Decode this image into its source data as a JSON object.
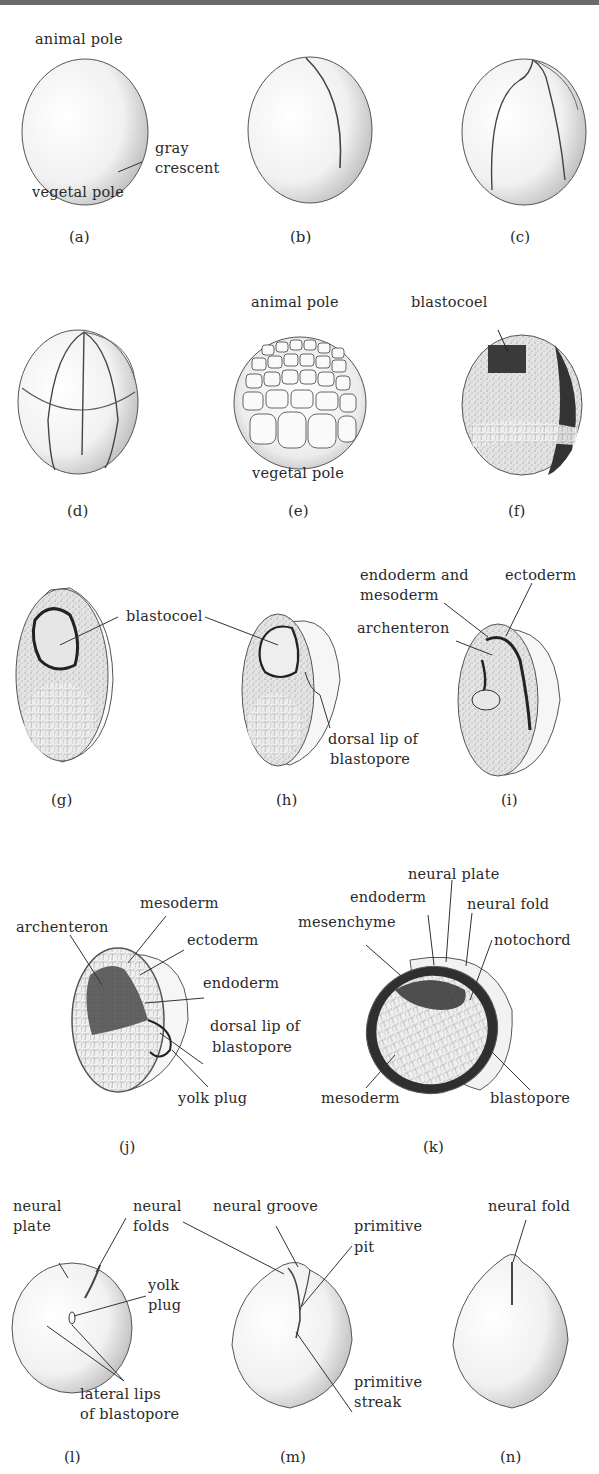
{
  "figure": {
    "panels": [
      {
        "id": "a",
        "caption": "(a)",
        "labels": {
          "animal_pole": "animal pole",
          "gray_crescent_1": "gray",
          "gray_crescent_2": "crescent",
          "vegetal_pole": "vegetal pole"
        }
      },
      {
        "id": "b",
        "caption": "(b)",
        "labels": {}
      },
      {
        "id": "c",
        "caption": "(c)",
        "labels": {}
      },
      {
        "id": "d",
        "caption": "(d)",
        "labels": {}
      },
      {
        "id": "e",
        "caption": "(e)",
        "labels": {
          "animal_pole": "animal pole",
          "vegetal_pole": "vegetal pole"
        }
      },
      {
        "id": "f",
        "caption": "(f)",
        "labels": {
          "blastocoel": "blastocoel"
        }
      },
      {
        "id": "g",
        "caption": "(g)",
        "labels": {}
      },
      {
        "id": "h",
        "caption": "(h)",
        "labels": {
          "blastocoel": "blastocoel",
          "dorsal_lip_1": "dorsal lip of",
          "dorsal_lip_2": "blastopore"
        }
      },
      {
        "id": "i",
        "caption": "(i)",
        "labels": {
          "endo_meso_1": "endoderm and",
          "endo_meso_2": "mesoderm",
          "ectoderm": "ectoderm",
          "archenteron": "archenteron"
        }
      },
      {
        "id": "j",
        "caption": "(j)",
        "labels": {
          "mesoderm": "mesoderm",
          "archenteron": "archenteron",
          "ectoderm": "ectoderm",
          "endoderm": "endoderm",
          "dorsal_lip_1": "dorsal lip of",
          "dorsal_lip_2": "blastopore",
          "yolk_plug": "yolk plug"
        }
      },
      {
        "id": "k",
        "caption": "(k)",
        "labels": {
          "neural_plate": "neural plate",
          "endoderm": "endoderm",
          "neural_fold": "neural fold",
          "mesenchyme": "mesenchyme",
          "notochord": "notochord",
          "mesoderm": "mesoderm",
          "blastopore": "blastopore"
        }
      },
      {
        "id": "l",
        "caption": "(l)",
        "labels": {
          "neural_plate_1": "neural",
          "neural_plate_2": "plate",
          "neural_folds_1": "neural",
          "neural_folds_2": "folds",
          "yolk_plug_1": "yolk",
          "yolk_plug_2": "plug",
          "lateral_lips_1": "lateral lips",
          "lateral_lips_2": "of blastopore"
        }
      },
      {
        "id": "m",
        "caption": "(m)",
        "labels": {
          "neural_groove": "neural groove",
          "primitive_pit_1": "primitive",
          "primitive_pit_2": "pit",
          "primitive_streak_1": "primitive",
          "primitive_streak_2": "streak"
        }
      },
      {
        "id": "n",
        "caption": "(n)",
        "labels": {
          "neural_fold": "neural fold"
        }
      }
    ]
  }
}
